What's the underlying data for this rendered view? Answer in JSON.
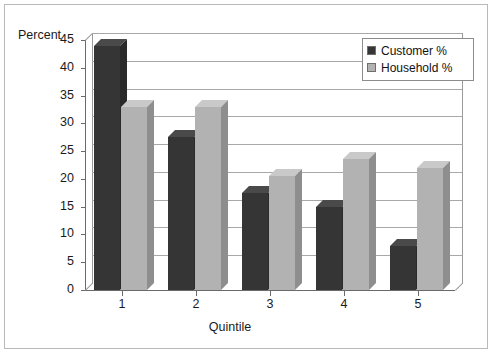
{
  "chart_data": {
    "type": "bar",
    "title": "",
    "xlabel": "Quintile",
    "ylabel": "Percent",
    "categories": [
      "1",
      "2",
      "3",
      "4",
      "5"
    ],
    "series": [
      {
        "name": "Customer %",
        "color": "#353535",
        "values": [
          44,
          27.5,
          17.5,
          15,
          8
        ]
      },
      {
        "name": "Household %",
        "color": "#b2b2b2",
        "values": [
          33,
          33,
          20.5,
          23.5,
          22
        ]
      }
    ],
    "ylim": [
      0,
      45
    ],
    "yticks": [
      "0",
      "5",
      "10",
      "15",
      "20",
      "25",
      "30",
      "35",
      "40",
      "45"
    ],
    "grid": true,
    "legend_position": "top-right",
    "three_d": true
  },
  "legend": {
    "items": [
      {
        "label": "Customer %",
        "swatch": "#353535"
      },
      {
        "label": "Household %",
        "swatch": "#b2b2b2"
      }
    ]
  }
}
